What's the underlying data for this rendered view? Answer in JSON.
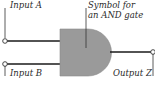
{
  "diagram": {
    "labels": {
      "input_a": "Input A",
      "input_b": "Input B",
      "output_z": "Output Z",
      "gate_caption_line1": "Symbol for",
      "gate_caption_line2": "an AND gate"
    },
    "colors": {
      "gate_fill": "#9a9a9a",
      "wire": "#1a1a1a",
      "text": "#2a2a2a",
      "background": "#ffffff"
    }
  }
}
